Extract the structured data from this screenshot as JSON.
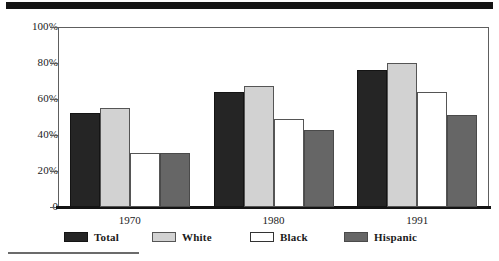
{
  "chart_data": {
    "type": "bar",
    "title": "",
    "subtitle": "",
    "xlabel": "",
    "ylabel": "",
    "categories": [
      "1970",
      "1980",
      "1991"
    ],
    "series": [
      {
        "name": "Total",
        "color": "#252525",
        "values": [
          52,
          64,
          76
        ]
      },
      {
        "name": "White",
        "color": "#d2d2d2",
        "values": [
          55,
          67,
          80
        ]
      },
      {
        "name": "Black",
        "color": "#ffffff",
        "values": [
          30,
          49,
          64
        ]
      },
      {
        "name": "Hispanic",
        "color": "#666666",
        "values": [
          30,
          43,
          51
        ]
      }
    ],
    "ylim": [
      0,
      100
    ],
    "yticks": [
      0,
      20,
      40,
      60,
      80,
      100
    ],
    "ytick_labels": [
      "0",
      "20%",
      "40%",
      "60%",
      "80%",
      "100%"
    ],
    "grid": false,
    "legend_position": "bottom"
  },
  "legend": {
    "items": [
      {
        "label": "Total",
        "swatch": "total"
      },
      {
        "label": "White",
        "swatch": "white"
      },
      {
        "label": "Black",
        "swatch": "black"
      },
      {
        "label": "Hispanic",
        "swatch": "hispanic"
      }
    ]
  },
  "decorations": {
    "top_rule": "thick-black-rule",
    "footnote_rule": "thin-gray-rule"
  }
}
